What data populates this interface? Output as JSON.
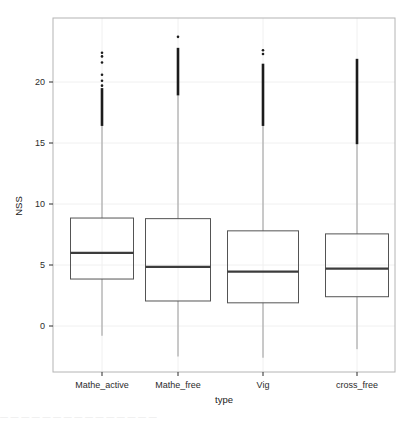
{
  "chart_data": {
    "type": "box",
    "title": "",
    "xlabel": "type",
    "ylabel": "NSS",
    "categories": [
      "Mathe_active",
      "Mathe_free",
      "Vig",
      "cross_free"
    ],
    "ylim": [
      -3.2,
      24.5
    ],
    "yticks": [
      0,
      5,
      10,
      15,
      20
    ],
    "ytick_labels": [
      "0",
      "5",
      "10",
      "15",
      "20"
    ],
    "grid": true,
    "legend": "none",
    "boxes": [
      {
        "name": "Mathe_active",
        "q1": 3.85,
        "median": 6.0,
        "q3": 8.85,
        "whisker_low": -0.8,
        "whisker_high": 16.4,
        "outlier_cluster_low": 16.4,
        "outlier_cluster_high": 19.5,
        "outliers": [
          22.4,
          22.1,
          21.6,
          20.6,
          20.1,
          19.7,
          19.4,
          19.1,
          18.8,
          18.5,
          18.2,
          17.9,
          17.6,
          17.3,
          17.0,
          16.8,
          16.6,
          16.4
        ]
      },
      {
        "name": "Mathe_free",
        "q1": 2.05,
        "median": 4.85,
        "q3": 8.8,
        "whisker_low": -2.5,
        "whisker_high": 18.9,
        "outlier_cluster_low": 18.9,
        "outlier_cluster_high": 22.8,
        "outliers": [
          23.7,
          22.8,
          22.5,
          22.2,
          21.9,
          21.6,
          21.3,
          21.0,
          20.7,
          20.4,
          20.1,
          19.8,
          19.5,
          19.2,
          18.9
        ]
      },
      {
        "name": "Vig",
        "q1": 1.9,
        "median": 4.45,
        "q3": 7.8,
        "whisker_low": -2.6,
        "whisker_high": 16.4,
        "outlier_cluster_low": 16.4,
        "outlier_cluster_high": 21.5,
        "outliers": [
          22.6,
          22.3,
          21.5,
          21.1,
          20.7,
          20.3,
          19.9,
          19.5,
          19.1,
          18.7,
          18.3,
          17.9,
          17.5,
          17.1,
          16.7,
          16.4
        ]
      },
      {
        "name": "cross_free",
        "q1": 2.4,
        "median": 4.7,
        "q3": 7.55,
        "whisker_low": -1.9,
        "whisker_high": 14.9,
        "outlier_cluster_low": 14.9,
        "outlier_cluster_high": 21.9,
        "outliers": [
          21.9,
          21.5,
          21.1,
          20.8,
          20.4,
          20.0,
          19.6,
          19.2,
          18.8,
          18.4,
          18.0,
          17.6,
          17.2,
          16.8,
          16.4,
          16.0,
          15.6,
          15.2,
          14.9
        ]
      }
    ],
    "colors": {
      "box_stroke": "#545454",
      "median_stroke": "#3c3c3c",
      "whisker_stroke": "#9a9a9a",
      "outlier_fill": "#1c1c1c",
      "grid": "#f0f0f0",
      "frame": "#b4b4b4",
      "text": "#2b2b2b"
    }
  },
  "caption": {
    "cut_off_text": "— — —   — —   — — —  —  —   —    —       —          — —"
  }
}
